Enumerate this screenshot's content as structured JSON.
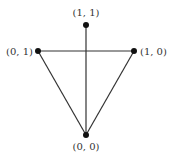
{
  "diagram": {
    "nodes": [
      {
        "id": "top",
        "label": "(1, 1)",
        "x": 86,
        "y": 25,
        "lx": 86,
        "ly": 15,
        "anchor": "middle"
      },
      {
        "id": "left",
        "label": "(0, 1)",
        "x": 38,
        "y": 51,
        "lx": 33,
        "ly": 55,
        "anchor": "end"
      },
      {
        "id": "right",
        "label": "(1, 0)",
        "x": 134,
        "y": 51,
        "lx": 140,
        "ly": 55,
        "anchor": "start"
      },
      {
        "id": "bottom",
        "label": "(0, 0)",
        "x": 86,
        "y": 135,
        "lx": 86,
        "ly": 150,
        "anchor": "middle"
      }
    ],
    "edges": [
      [
        "left",
        "right"
      ],
      [
        "left",
        "bottom"
      ],
      [
        "right",
        "bottom"
      ],
      [
        "top",
        "bottom"
      ]
    ],
    "colors": {
      "line": "#333333",
      "node": "#111111",
      "label": "#333333"
    }
  }
}
